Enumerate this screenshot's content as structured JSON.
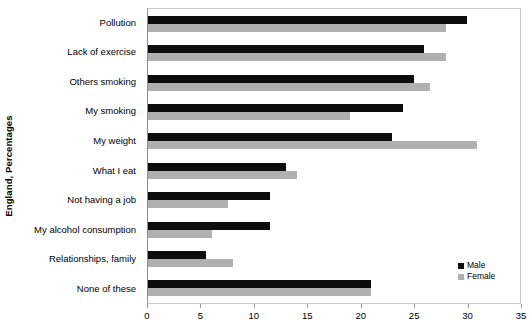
{
  "chart_data": {
    "type": "bar",
    "orientation": "horizontal",
    "title": "",
    "xlabel": "",
    "ylabel": "England, Percentages",
    "xlim": [
      0,
      35
    ],
    "xticks": [
      0,
      5,
      10,
      15,
      20,
      25,
      30,
      35
    ],
    "grid": false,
    "legend_position": "bottom-right",
    "categories": [
      "Pollution",
      "Lack of exercise",
      "Others smoking",
      "My smoking",
      "My weight",
      "What I eat",
      "Not having a job",
      "My alcohol consumption",
      "Relationships, family",
      "None of these"
    ],
    "series": [
      {
        "name": "Male",
        "color": "#0d0d0d",
        "values": [
          30,
          26,
          25,
          24,
          23,
          13,
          11.5,
          11.5,
          5.5,
          21
        ]
      },
      {
        "name": "Female",
        "color": "#b0b0b0",
        "values": [
          28,
          28,
          26.5,
          19,
          31,
          14,
          7.5,
          6,
          8,
          21
        ]
      }
    ]
  },
  "legend": {
    "items": [
      {
        "label": "Male",
        "swatch": "male"
      },
      {
        "label": "Female",
        "swatch": "female"
      }
    ]
  }
}
